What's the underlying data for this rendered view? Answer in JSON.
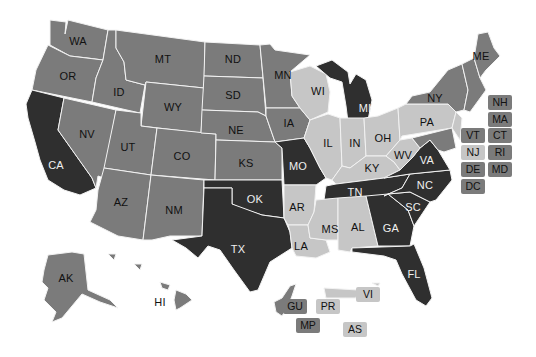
{
  "map": {
    "title": "",
    "colors": {
      "dark": "#2f2f2f",
      "medium": "#7b7b7b",
      "light": "#c6c6c6",
      "border": "#f2f2f2",
      "background": "#ffffff"
    },
    "states": [
      {
        "code": "WA",
        "shade": "medium",
        "x": 78,
        "y": 41
      },
      {
        "code": "OR",
        "shade": "medium",
        "x": 68,
        "y": 76
      },
      {
        "code": "CA",
        "shade": "dark",
        "x": 56,
        "y": 165
      },
      {
        "code": "ID",
        "shade": "medium",
        "x": 119,
        "y": 92
      },
      {
        "code": "NV",
        "shade": "medium",
        "x": 87,
        "y": 134
      },
      {
        "code": "MT",
        "shade": "medium",
        "x": 163,
        "y": 59
      },
      {
        "code": "WY",
        "shade": "medium",
        "x": 173,
        "y": 107
      },
      {
        "code": "UT",
        "shade": "medium",
        "x": 128,
        "y": 147
      },
      {
        "code": "CO",
        "shade": "medium",
        "x": 182,
        "y": 156
      },
      {
        "code": "AZ",
        "shade": "medium",
        "x": 121,
        "y": 202
      },
      {
        "code": "NM",
        "shade": "medium",
        "x": 174,
        "y": 210
      },
      {
        "code": "ND",
        "shade": "medium",
        "x": 233,
        "y": 59
      },
      {
        "code": "SD",
        "shade": "medium",
        "x": 233,
        "y": 95
      },
      {
        "code": "NE",
        "shade": "medium",
        "x": 236,
        "y": 130
      },
      {
        "code": "KS",
        "shade": "medium",
        "x": 246,
        "y": 163
      },
      {
        "code": "OK",
        "shade": "dark",
        "x": 255,
        "y": 199
      },
      {
        "code": "TX",
        "shade": "dark",
        "x": 238,
        "y": 249
      },
      {
        "code": "MN",
        "shade": "medium",
        "x": 283,
        "y": 75
      },
      {
        "code": "IA",
        "shade": "medium",
        "x": 289,
        "y": 123
      },
      {
        "code": "MO",
        "shade": "dark",
        "x": 298,
        "y": 166
      },
      {
        "code": "AR",
        "shade": "light",
        "x": 297,
        "y": 207
      },
      {
        "code": "LA",
        "shade": "light",
        "x": 301,
        "y": 246
      },
      {
        "code": "WI",
        "shade": "light",
        "x": 318,
        "y": 91
      },
      {
        "code": "IL",
        "shade": "light",
        "x": 328,
        "y": 143
      },
      {
        "code": "MI",
        "shade": "dark",
        "x": 365,
        "y": 108
      },
      {
        "code": "IN",
        "shade": "light",
        "x": 355,
        "y": 143
      },
      {
        "code": "OH",
        "shade": "light",
        "x": 383,
        "y": 138
      },
      {
        "code": "KY",
        "shade": "light",
        "x": 372,
        "y": 168
      },
      {
        "code": "TN",
        "shade": "dark",
        "x": 355,
        "y": 192
      },
      {
        "code": "MS",
        "shade": "light",
        "x": 330,
        "y": 229
      },
      {
        "code": "AL",
        "shade": "light",
        "x": 358,
        "y": 227
      },
      {
        "code": "GA",
        "shade": "dark",
        "x": 391,
        "y": 228
      },
      {
        "code": "FL",
        "shade": "dark",
        "x": 414,
        "y": 274
      },
      {
        "code": "SC",
        "shade": "dark",
        "x": 413,
        "y": 207
      },
      {
        "code": "NC",
        "shade": "dark",
        "x": 425,
        "y": 185
      },
      {
        "code": "VA",
        "shade": "dark",
        "x": 427,
        "y": 160
      },
      {
        "code": "WV",
        "shade": "light",
        "x": 403,
        "y": 155
      },
      {
        "code": "PA",
        "shade": "light",
        "x": 427,
        "y": 122
      },
      {
        "code": "NY",
        "shade": "medium",
        "x": 435,
        "y": 98
      },
      {
        "code": "ME",
        "shade": "medium",
        "x": 481,
        "y": 56
      },
      {
        "code": "AK",
        "shade": "medium",
        "x": 66,
        "y": 278
      },
      {
        "code": "HI",
        "shade": "medium",
        "x": 160,
        "y": 302
      }
    ],
    "small_state_boxes": [
      {
        "code": "NH",
        "shade": "medium",
        "x": 500,
        "y": 102
      },
      {
        "code": "MA",
        "shade": "medium",
        "x": 500,
        "y": 119
      },
      {
        "code": "VT",
        "shade": "medium",
        "x": 473,
        "y": 135
      },
      {
        "code": "CT",
        "shade": "medium",
        "x": 500,
        "y": 135
      },
      {
        "code": "NJ",
        "shade": "light",
        "x": 473,
        "y": 152
      },
      {
        "code": "RI",
        "shade": "medium",
        "x": 500,
        "y": 152
      },
      {
        "code": "DE",
        "shade": "medium",
        "x": 473,
        "y": 169
      },
      {
        "code": "MD",
        "shade": "medium",
        "x": 500,
        "y": 169
      },
      {
        "code": "DC",
        "shade": "medium",
        "x": 473,
        "y": 186
      },
      {
        "code": "GU",
        "shade": "medium",
        "x": 295,
        "y": 306
      },
      {
        "code": "PR",
        "shade": "light",
        "x": 328,
        "y": 306
      },
      {
        "code": "VI",
        "shade": "light",
        "x": 368,
        "y": 294
      },
      {
        "code": "MP",
        "shade": "medium",
        "x": 308,
        "y": 325
      },
      {
        "code": "AS",
        "shade": "light",
        "x": 355,
        "y": 329
      }
    ]
  }
}
